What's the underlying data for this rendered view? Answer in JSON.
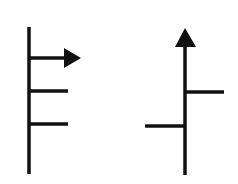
{
  "diagram": {
    "stroke_color": "#111111",
    "background": "#ffffff",
    "figures": [
      {
        "name": "left-figure",
        "description": "vertical stem with horizontal arrow pointing right at top and two horizontal branches to the right",
        "stem": {
          "x": 29,
          "y1": 27,
          "y2": 174
        },
        "arrow": {
          "direction": "right",
          "y": 58,
          "x1": 29,
          "x2": 66,
          "tip_x": 81
        },
        "branches": [
          {
            "side": "right",
            "y": 91,
            "x1": 29,
            "x2": 68
          },
          {
            "side": "right",
            "y": 124,
            "x1": 29,
            "x2": 68
          }
        ]
      },
      {
        "name": "right-figure",
        "description": "vertical stem with upward arrow at top, a right branch higher and a left branch lower",
        "stem": {
          "x": 185,
          "y1": 46,
          "y2": 175
        },
        "arrow": {
          "direction": "up",
          "tip_y": 28,
          "base_y": 47
        },
        "branches": [
          {
            "side": "right",
            "y": 92,
            "x1": 185,
            "x2": 224
          },
          {
            "side": "left",
            "y": 126,
            "x1": 145,
            "x2": 185
          }
        ]
      }
    ]
  }
}
